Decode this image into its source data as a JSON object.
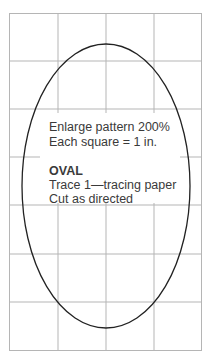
{
  "diagram": {
    "type": "sewing-pattern",
    "grid": {
      "columns": 4,
      "rows": 7,
      "cell_size_label": "1 in."
    },
    "shape": "oval",
    "instructions": {
      "line1": "Enlarge pattern 200%",
      "line2": "Each square = 1 in."
    },
    "piece": {
      "name": "OVAL",
      "line1": "Trace 1—tracing paper",
      "line2": "Cut as directed"
    },
    "colors": {
      "grid": "#b0b0b0",
      "outline": "#222222",
      "text": "#3a3a3a"
    }
  }
}
